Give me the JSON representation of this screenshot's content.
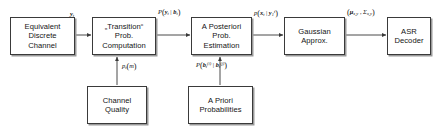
{
  "diagram": {
    "colors": {
      "box_border": "#3a3a3a",
      "box_fill": "#ffffff",
      "shadow": "#9a9a9a",
      "wire": "#4a4a4a",
      "text": "#141414",
      "background": "#ffffff"
    },
    "blocks": [
      {
        "id": "equivalent-discrete-channel",
        "lines": [
          "Equivalent",
          "Discrete",
          "Channel"
        ]
      },
      {
        "id": "transition-prob-computation",
        "lines": [
          "„Transition“",
          "Prob.",
          "Computation"
        ]
      },
      {
        "id": "a-posteriori-prob-estimation",
        "lines": [
          "A Posteriori",
          "Prob.",
          "Estimation"
        ]
      },
      {
        "id": "gaussian-approx",
        "lines": [
          "Gaussian",
          "Approx."
        ]
      },
      {
        "id": "asr-decoder",
        "lines": [
          "ASR",
          "Decoder"
        ]
      },
      {
        "id": "channel-quality",
        "lines": [
          "Channel",
          "Quality"
        ]
      },
      {
        "id": "a-priori-probabilities",
        "lines": [
          "A Priori",
          "Probabilities"
        ]
      }
    ],
    "edge_labels": [
      {
        "id": "signal-y-t",
        "text": "y_t"
      },
      {
        "id": "transition-prob",
        "text": "P(y_t | b_t)"
      },
      {
        "id": "posterior-prob",
        "text": "p(x_t | y_1^t)"
      },
      {
        "id": "gaussian-params",
        "text": "(μ_x,y , Σ_x,y)"
      },
      {
        "id": "channel-quality-metric",
        "text": "p_t(m)"
      },
      {
        "id": "a-priori-prob",
        "text": "P(b_t^(i) | b_t^(j))"
      }
    ]
  }
}
